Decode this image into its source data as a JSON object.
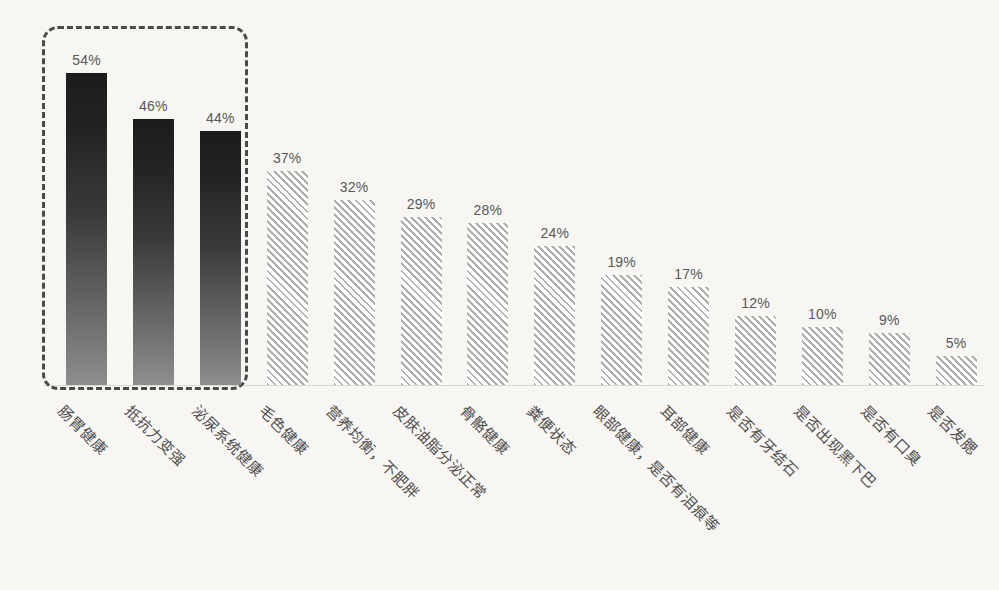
{
  "chart_data": {
    "type": "bar",
    "title": "",
    "subtitle": "",
    "xlabel": "",
    "ylabel": "",
    "ylim": [
      0,
      60
    ],
    "grid": false,
    "legend": "none",
    "value_suffix": "%",
    "categories": [
      "肠胃健康",
      "抵抗力变强",
      "泌尿系统健康",
      "毛色健康",
      "营养均衡，不肥胖",
      "皮肤油脂分泌正常",
      "骨骼健康",
      "粪便状态",
      "眼部健康，是否有泪痕等",
      "耳部健康",
      "是否有牙结石",
      "是否出现黑下巴",
      "是否有口臭",
      "是否发腮"
    ],
    "values": [
      54,
      46,
      44,
      37,
      32,
      29,
      28,
      24,
      19,
      17,
      12,
      10,
      9,
      5
    ],
    "value_labels": [
      "54%",
      "46%",
      "44%",
      "37%",
      "32%",
      "29%",
      "28%",
      "24%",
      "19%",
      "17%",
      "12%",
      "10%",
      "9%",
      "5%"
    ],
    "styles": [
      "solid",
      "solid",
      "solid",
      "hatched",
      "hatched",
      "hatched",
      "hatched",
      "hatched",
      "hatched",
      "hatched",
      "hatched",
      "hatched",
      "hatched",
      "hatched"
    ],
    "annotations": [
      {
        "type": "dashed-highlight-box",
        "label": "highlighted-top-three",
        "covers": [
          "肠胃健康",
          "抵抗力变强",
          "泌尿系统健康"
        ]
      }
    ]
  },
  "colors": {
    "background": "#f7f6f3",
    "solid_bar_top": "#1c1c1c",
    "solid_bar_bottom": "#8e8e8e",
    "hatch_line": "#b0aeaa",
    "hatch_fill": "#ffffff",
    "axis_line": "#d9d7d2",
    "value_text": "#585858",
    "category_text": "#4f4f4f",
    "highlight_border": "#4a4a4a"
  }
}
